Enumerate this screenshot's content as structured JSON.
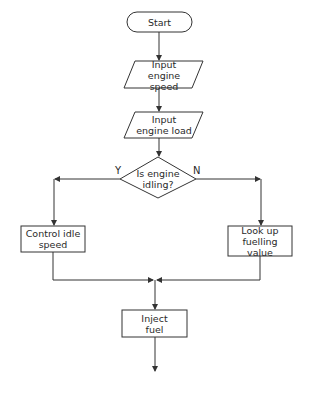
{
  "flowchart": {
    "nodes": [
      {
        "id": "start",
        "type": "terminator",
        "label": "Start"
      },
      {
        "id": "input_speed",
        "type": "io",
        "label": "Input engine speed"
      },
      {
        "id": "input_load",
        "type": "io",
        "label": "Input engine load"
      },
      {
        "id": "decision",
        "type": "decision",
        "label": "Is engine idling?"
      },
      {
        "id": "control_idle",
        "type": "process",
        "label": "Control idle speed"
      },
      {
        "id": "lookup",
        "type": "process",
        "label": "Look up fuelling value"
      },
      {
        "id": "inject",
        "type": "process",
        "label": "Inject fuel"
      }
    ],
    "branches": {
      "yes": "Y",
      "no": "N"
    },
    "edges": [
      {
        "from": "start",
        "to": "input_speed"
      },
      {
        "from": "input_speed",
        "to": "input_load"
      },
      {
        "from": "input_load",
        "to": "decision"
      },
      {
        "from": "decision",
        "to": "control_idle",
        "label": "Y"
      },
      {
        "from": "decision",
        "to": "lookup",
        "label": "N"
      },
      {
        "from": "control_idle",
        "to": "inject"
      },
      {
        "from": "lookup",
        "to": "inject"
      }
    ],
    "colors": {
      "stroke": "#333333",
      "text": "#2a2a2a",
      "background": "#ffffff"
    }
  }
}
